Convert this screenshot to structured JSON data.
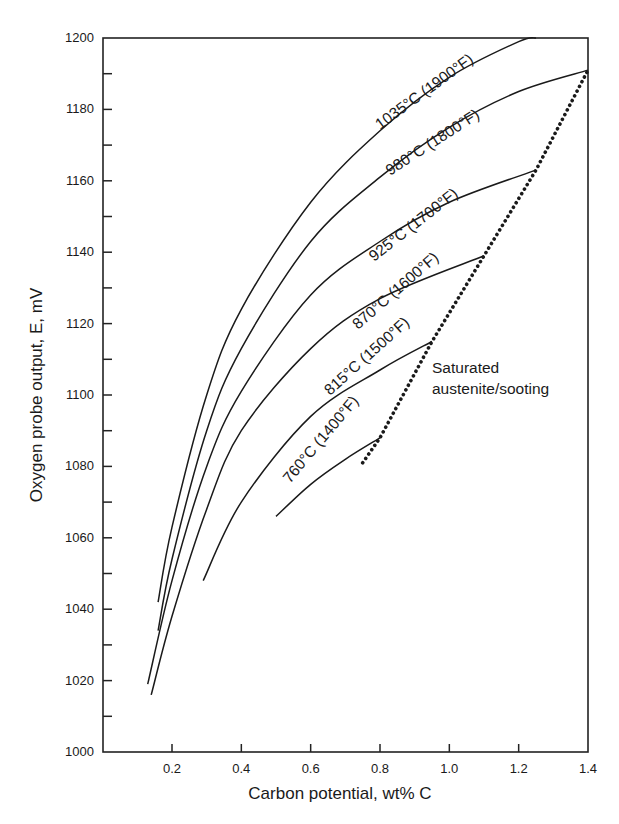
{
  "chart_data": {
    "type": "line",
    "title": "",
    "xlabel": "Carbon potential, wt% C",
    "ylabel": "Oxygen probe output, E, mV",
    "xlim": [
      0.0,
      1.4
    ],
    "ylim": [
      1000,
      1200
    ],
    "x_ticks": [
      "0.2",
      "0.4",
      "0.6",
      "0.8",
      "1.0",
      "1.2",
      "1.4"
    ],
    "y_ticks": [
      "1000",
      "1020",
      "1040",
      "1060",
      "1080",
      "1100",
      "1120",
      "1140",
      "1160",
      "1180",
      "1200"
    ],
    "grid": false,
    "legend": "none (inline curve labels)",
    "series": [
      {
        "name": "1035°C (1900°F)",
        "x": [
          0.16,
          0.2,
          0.3,
          0.4,
          0.6,
          0.8,
          1.0,
          1.2,
          1.25
        ],
        "y": [
          1042,
          1063,
          1100,
          1124,
          1154,
          1174,
          1189,
          1199,
          1200
        ]
      },
      {
        "name": "980°C (1800°F)",
        "x": [
          0.16,
          0.2,
          0.3,
          0.4,
          0.6,
          0.8,
          1.0,
          1.2,
          1.4
        ],
        "y": [
          1034,
          1054,
          1090,
          1113,
          1143,
          1161,
          1175,
          1185,
          1191
        ]
      },
      {
        "name": "925°C (1700°F)",
        "x": [
          0.13,
          0.2,
          0.3,
          0.4,
          0.6,
          0.8,
          1.0,
          1.25
        ],
        "y": [
          1019,
          1048,
          1080,
          1101,
          1128,
          1143,
          1154,
          1163
        ]
      },
      {
        "name": "870°C (1600°F)",
        "x": [
          0.14,
          0.2,
          0.3,
          0.4,
          0.6,
          0.8,
          1.1
        ],
        "y": [
          1016,
          1038,
          1068,
          1090,
          1113,
          1127,
          1139
        ]
      },
      {
        "name": "815°C (1500°F)",
        "x": [
          0.29,
          0.4,
          0.6,
          0.8,
          0.95
        ],
        "y": [
          1048,
          1070,
          1094,
          1107,
          1115
        ]
      },
      {
        "name": "760°C (1400°F)",
        "x": [
          0.5,
          0.6,
          0.7,
          0.8
        ],
        "y": [
          1066,
          1075,
          1082,
          1088
        ]
      },
      {
        "name": "Saturated austenite/sooting",
        "style": "dotted",
        "x": [
          0.75,
          0.8,
          0.95,
          1.1,
          1.25,
          1.4
        ],
        "y": [
          1081,
          1088,
          1115,
          1139,
          1163,
          1191
        ]
      }
    ],
    "annotations": [
      "Saturated",
      "austenite/sooting"
    ]
  },
  "labels": {
    "curves": [
      "1035°C (1900°F)",
      "980°C (1800°F)",
      "925°C (1700°F)",
      "870°C (1600°F)",
      "815°C (1500°F)",
      "760°C (1400°F)"
    ],
    "annotation_line1": "Saturated",
    "annotation_line2": "austenite/sooting"
  }
}
